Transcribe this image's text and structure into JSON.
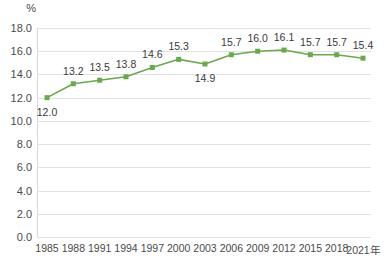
{
  "chart_data": {
    "type": "line",
    "title": "",
    "subtitle": "",
    "xlabel": "",
    "ylabel": "%",
    "unit_label": "%",
    "x_axis_suffix": "年",
    "categories": [
      "1985",
      "1988",
      "1991",
      "1994",
      "1997",
      "2000",
      "2003",
      "2006",
      "2009",
      "2012",
      "2015",
      "2018",
      "2021年"
    ],
    "values": [
      12.0,
      13.2,
      13.5,
      13.8,
      14.6,
      15.3,
      14.9,
      15.7,
      16.0,
      16.1,
      15.7,
      15.7,
      15.4
    ],
    "point_labels": [
      "12.0",
      "13.2",
      "13.5",
      "13.8",
      "14.6",
      "15.3",
      "14.9",
      "15.7",
      "16.0",
      "16.1",
      "15.7",
      "15.7",
      "15.4"
    ],
    "label_positions": [
      "below",
      "above",
      "above",
      "above",
      "above",
      "above",
      "below",
      "above",
      "above",
      "above",
      "above",
      "above",
      "above"
    ],
    "ylim": [
      0.0,
      18.0
    ],
    "ytick_step": 2.0,
    "yticks": [
      "0.0",
      "2.0",
      "4.0",
      "6.0",
      "8.0",
      "10.0",
      "12.0",
      "14.0",
      "16.0",
      "18.0"
    ],
    "grid": true,
    "legend": "none",
    "series_color": "#6aa84f",
    "marker_color": "#6aa84f",
    "marker_shape": "square",
    "grid_color": "#e2e2e2",
    "text_color": "#4a4a4a",
    "background_color": "#ffffff"
  }
}
